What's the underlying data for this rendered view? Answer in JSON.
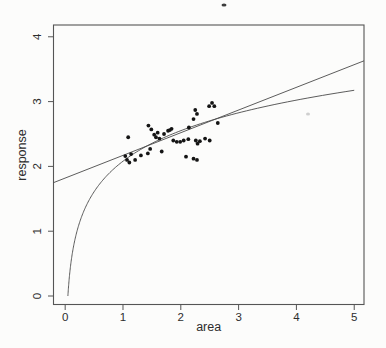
{
  "figure": {
    "background": "#fcfcfb",
    "frame_color": "#555555",
    "line_color": "#4a4a4a",
    "point_color": "#141414",
    "text_color": "#2d2d2d"
  },
  "chart_data": {
    "type": "scatter",
    "title": "",
    "xlabel": "area",
    "ylabel": "response",
    "x_ticks": [
      0,
      1,
      2,
      3,
      4,
      5
    ],
    "y_ticks": [
      0,
      1,
      2,
      3,
      4
    ],
    "xlim": [
      -0.202,
      5.169
    ],
    "ylim": [
      -0.131,
      4.182
    ],
    "grid": false,
    "legend": null,
    "points": [
      [
        1.04,
        2.16
      ],
      [
        1.07,
        2.1
      ],
      [
        1.11,
        2.06
      ],
      [
        1.14,
        2.19
      ],
      [
        1.21,
        2.1
      ],
      [
        1.31,
        2.17
      ],
      [
        1.09,
        2.45
      ],
      [
        1.44,
        2.63
      ],
      [
        1.49,
        2.57
      ],
      [
        1.47,
        2.27
      ],
      [
        1.43,
        2.2
      ],
      [
        1.54,
        2.49
      ],
      [
        1.57,
        2.45
      ],
      [
        1.6,
        2.52
      ],
      [
        1.63,
        2.43
      ],
      [
        1.67,
        2.23
      ],
      [
        1.71,
        2.5
      ],
      [
        1.78,
        2.55
      ],
      [
        1.81,
        2.56
      ],
      [
        1.84,
        2.58
      ],
      [
        1.87,
        2.4
      ],
      [
        1.93,
        2.38
      ],
      [
        1.99,
        2.38
      ],
      [
        2.05,
        2.4
      ],
      [
        2.13,
        2.42
      ],
      [
        2.14,
        2.6
      ],
      [
        2.22,
        2.73
      ],
      [
        2.25,
        2.87
      ],
      [
        2.28,
        2.81
      ],
      [
        2.26,
        2.4
      ],
      [
        2.29,
        2.35
      ],
      [
        2.09,
        2.15
      ],
      [
        2.22,
        2.12
      ],
      [
        2.28,
        2.1
      ],
      [
        2.33,
        2.39
      ],
      [
        2.42,
        2.43
      ],
      [
        2.5,
        2.4
      ],
      [
        2.49,
        2.93
      ],
      [
        2.54,
        2.98
      ],
      [
        2.58,
        2.93
      ],
      [
        2.64,
        2.67
      ]
    ],
    "fits": [
      {
        "name": "linear-fit",
        "kind": "linear",
        "intercept": 1.82,
        "slope": 0.35,
        "x_start": -0.202,
        "x_end": 5.169
      },
      {
        "name": "log-fit",
        "kind": "log",
        "a": 2.08,
        "b": 0.68,
        "x_start": 0.047,
        "x_end": 5.0
      }
    ],
    "scan_artifacts": [
      {
        "px": 224,
        "py": 5,
        "w": 5,
        "h": 3,
        "color": "#3d3d3d"
      },
      {
        "px": 308,
        "py": 114,
        "w": 4,
        "h": 3,
        "color": "#cfcfcf"
      }
    ]
  }
}
